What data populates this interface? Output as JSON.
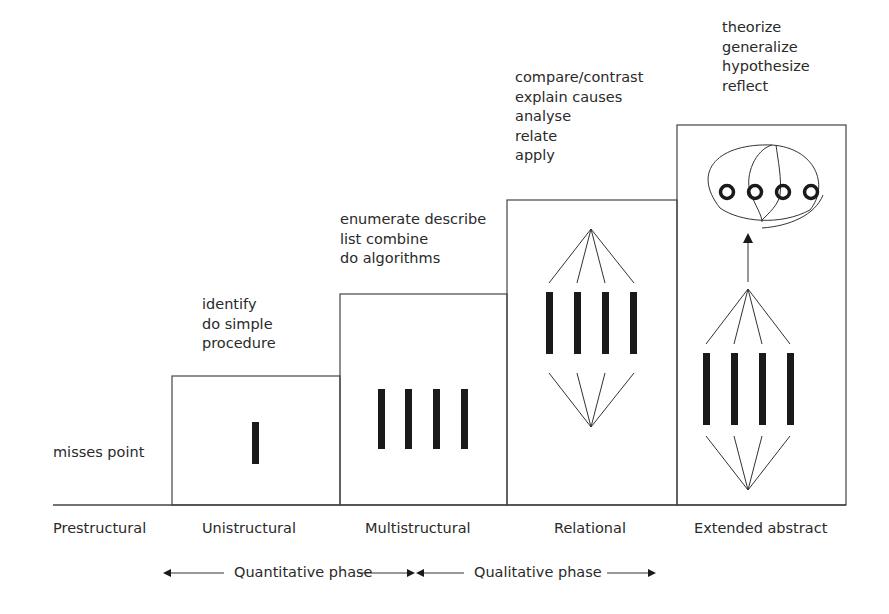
{
  "levels": [
    {
      "name": "Prestructural",
      "verbs": [
        "misses point"
      ]
    },
    {
      "name": "Unistructural",
      "verbs": [
        "identify",
        "do simple",
        "procedure"
      ]
    },
    {
      "name": "Multistructural",
      "verbs": [
        "enumerate describe",
        "list combine",
        "do algorithms"
      ]
    },
    {
      "name": "Relational",
      "verbs": [
        "compare/contrast",
        "explain causes",
        "analyse",
        "relate",
        "apply"
      ]
    },
    {
      "name": "Extended abstract",
      "verbs": [
        "theorize",
        "generalize",
        "hypothesize",
        "reflect"
      ]
    }
  ],
  "phases": [
    {
      "label": "Quantitative phase"
    },
    {
      "label": "Qualitative phase"
    }
  ],
  "colors": {
    "line": "#333333",
    "bar": "#1a1a1a",
    "text": "#2a2a2a"
  }
}
